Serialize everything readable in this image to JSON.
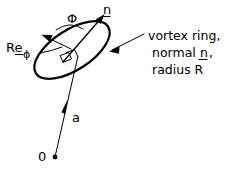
{
  "figure": {
    "background_color": "#ffffff",
    "stroke_color": "#000000",
    "labels": {
      "origin": "0",
      "position_vector": "a",
      "normal": "n",
      "angle": "Φ",
      "radius_vector_main": "Re",
      "radius_vector_sub": "ϕ"
    },
    "annotation": {
      "line1": "vortex ring,",
      "line2_prefix": "normal ",
      "line2_symbol": "n",
      "line2_suffix": ",",
      "line3": "radius R"
    },
    "elements": {
      "ring_name": "vortex-ring-ellipse",
      "normal_arrow_name": "normal-vector-arrow",
      "radius_arrow_name": "radius-vector-arrow",
      "position_arrow_name": "position-vector-arrow",
      "angle_arc_name": "angle-arc",
      "right_angle_name": "right-angle-marker",
      "origin_dot_name": "origin-dot",
      "callout_name": "callout-leader-arrow"
    }
  }
}
